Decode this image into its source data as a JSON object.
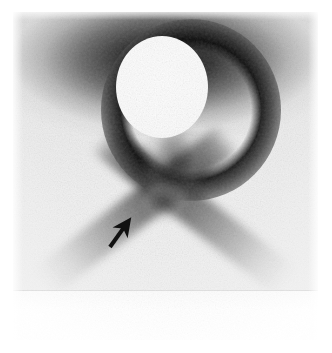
{
  "figure": {
    "kind": "nuclear-medicine-scintigram",
    "modality_label": "planar scintigraphy",
    "orientation": "anterior",
    "caption": "",
    "width_px": 332,
    "height_px": 353
  },
  "plate": {
    "left_px": 13,
    "top_px": 12,
    "width_px": 305,
    "height_px": 328,
    "background_color": "#f0f0f0",
    "paper_color": "#ffffff",
    "lower_band_edge_y_px": 290
  },
  "findings": [
    {
      "id": "cold-lesion",
      "name": "photopenic-sphere",
      "description": "Large round photopenic (cold) defect",
      "center_x_px": 162,
      "center_y_px": 87,
      "radius_px": 46,
      "fill_color": "#fdfdfd"
    },
    {
      "id": "uptake-halo",
      "name": "peripheral-rim-uptake",
      "description": "Dense rim of increased tracer uptake encircling the cold defect",
      "center_x_px": 191,
      "center_y_px": 110,
      "intensity": "intense",
      "color": "#0a0a0a"
    },
    {
      "id": "uptake-top",
      "name": "superior-uptake-band",
      "description": "Broad band of intense activity across the superior field",
      "intensity": "intense",
      "color": "#141414"
    },
    {
      "id": "uptake-band-left",
      "name": "left-oblique-uptake-chain",
      "description": "Oblique linear tracer accumulation descending to the left",
      "intensity": "moderate",
      "color": "#3e3e3e"
    },
    {
      "id": "uptake-band-right",
      "name": "right-oblique-uptake-chain",
      "description": "Oblique linear tracer accumulation descending to the right",
      "intensity": "moderate",
      "color": "#3e3e3e"
    },
    {
      "id": "uptake-midline",
      "name": "midline-uptake-column",
      "description": "Mottled midline column of activity inferior to the cold defect",
      "intensity": "moderate",
      "color": "#4b4b4b"
    },
    {
      "id": "uptake-nodule",
      "name": "focal-nodular-uptake",
      "description": "Focal nodular area of increased uptake indicated by the arrow",
      "center_x_px": 163,
      "center_y_px": 203,
      "intensity": "mild-moderate",
      "color": "#5a5a5a"
    }
  ],
  "annotation": {
    "arrow": {
      "name": "pointer-arrow",
      "label": "",
      "color": "#111111",
      "tail_x_px": 110,
      "tail_y_px": 247,
      "tip_x_px": 135,
      "tip_y_px": 212,
      "points_to": "focal-nodular-uptake",
      "stroke_width_px": 4
    }
  }
}
